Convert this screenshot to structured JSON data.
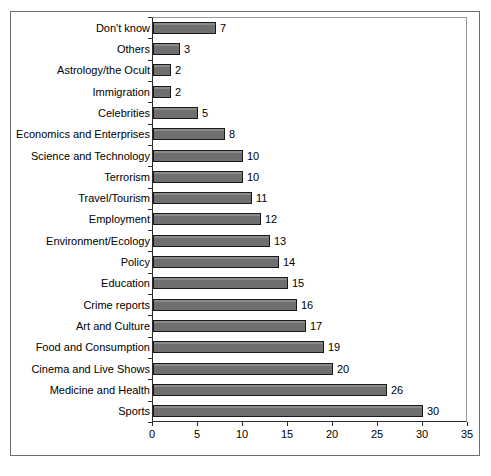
{
  "chart_data": {
    "type": "bar",
    "orientation": "horizontal",
    "title": "",
    "xlabel": "",
    "ylabel": "",
    "xlim": [
      0,
      35
    ],
    "xticks": [
      0,
      5,
      10,
      15,
      20,
      25,
      30,
      35
    ],
    "grid": false,
    "legend": false,
    "bar_color": "#757575",
    "bar_edge_color": "#1a1a1a",
    "show_value_labels": true,
    "categories": [
      "Don't know",
      "Others",
      "Astrology/the Ocult",
      "Immigration",
      "Celebrities",
      "Economics and Enterprises",
      "Science and Technology",
      "Terrorism",
      "Travel/Tourism",
      "Employment",
      "Environment/Ecology",
      "Policy",
      "Education",
      "Crime reports",
      "Art and Culture",
      "Food and Consumption",
      "Cinema and Live Shows",
      "Medicine and Health",
      "Sports"
    ],
    "values": [
      7,
      3,
      2,
      2,
      5,
      8,
      10,
      10,
      11,
      12,
      13,
      14,
      15,
      16,
      17,
      19,
      20,
      26,
      30
    ]
  }
}
